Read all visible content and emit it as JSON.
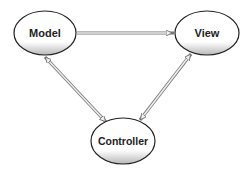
{
  "diagram": {
    "nodes": [
      {
        "id": "model",
        "label": "Model",
        "cx": 45,
        "cy": 33,
        "rx": 31,
        "ry": 22
      },
      {
        "id": "view",
        "label": "View",
        "cx": 207,
        "cy": 33,
        "rx": 32,
        "ry": 22
      },
      {
        "id": "controller",
        "label": "Controller",
        "cx": 123,
        "cy": 141,
        "rx": 32,
        "ry": 23
      }
    ],
    "edges": [
      {
        "from": "model",
        "to": "view",
        "direction": "one-way"
      },
      {
        "from": "model",
        "to": "controller",
        "direction": "two-way"
      },
      {
        "from": "view",
        "to": "controller",
        "direction": "two-way"
      }
    ],
    "colors": {
      "outline": "#222222",
      "arrow_fill": "#e8e8e8",
      "arrow_stroke": "#777777",
      "gradient_bottom": "#bbbbbb"
    }
  }
}
